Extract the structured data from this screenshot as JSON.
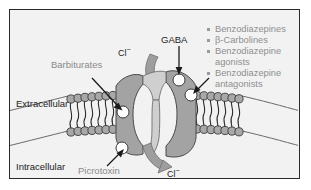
{
  "figure": {
    "title_alt": "GABA-A receptor chloride channel diagram",
    "compartments": {
      "extracellular_label": "Extracellular",
      "intracellular_label": "Intracellular"
    },
    "ion_labels": {
      "chloride_in": "Cl",
      "chloride_in_charge": "−",
      "chloride_out": "Cl",
      "chloride_out_charge": "−"
    },
    "annotations": {
      "gaba": "GABA",
      "barbiturates": "Barbiturates",
      "picrotoxin": "Picrotoxin"
    },
    "legend": {
      "items": [
        {
          "label": "Benzodiazepines",
          "continuation": ""
        },
        {
          "label": "β-Carbolines",
          "continuation": ""
        },
        {
          "label": "Benzodiazepine",
          "continuation": "agonists"
        },
        {
          "label": "Benzodiazepine",
          "continuation": "antagonists"
        }
      ]
    },
    "colors": {
      "frame_border": "#2a2a2a",
      "background": "#f2f2f2",
      "membrane_head": "#a8a8a8",
      "membrane_head_stroke": "#3a3a3a",
      "receptor_subunit": "#a3a3a3",
      "receptor_channel": "#cfcfcf",
      "binding_site": "#ffffff",
      "flow_arrow": "#9e9e9e",
      "pointer_arrow": "#1b1b1b",
      "text_gray": "#8f8f8f",
      "text_black": "#1b1b1b"
    }
  }
}
